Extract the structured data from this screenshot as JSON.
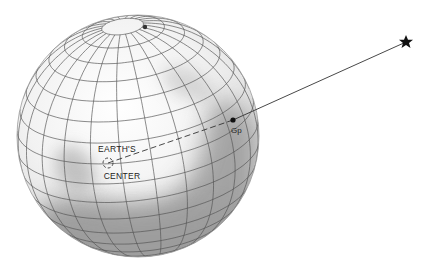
{
  "diagram": {
    "globe": {
      "cx": 138,
      "cy": 136,
      "r": 121,
      "meridian_count": 24,
      "parallel_step_deg": 10,
      "tilt_deg": 22,
      "colors": {
        "fill_light": "#f4f4f4",
        "shade": "#8a8a8a",
        "grid": "#555555"
      }
    },
    "labels": {
      "center_top": "EARTH'S",
      "center_bottom": "CENTER",
      "point": "Gp"
    },
    "points": {
      "center": {
        "x": 108,
        "y": 163
      },
      "gp": {
        "x": 233,
        "y": 120
      },
      "star": {
        "x": 406,
        "y": 42
      },
      "pole": {
        "x": 145,
        "y": 27
      }
    },
    "icons": {
      "star": "star-icon"
    }
  }
}
